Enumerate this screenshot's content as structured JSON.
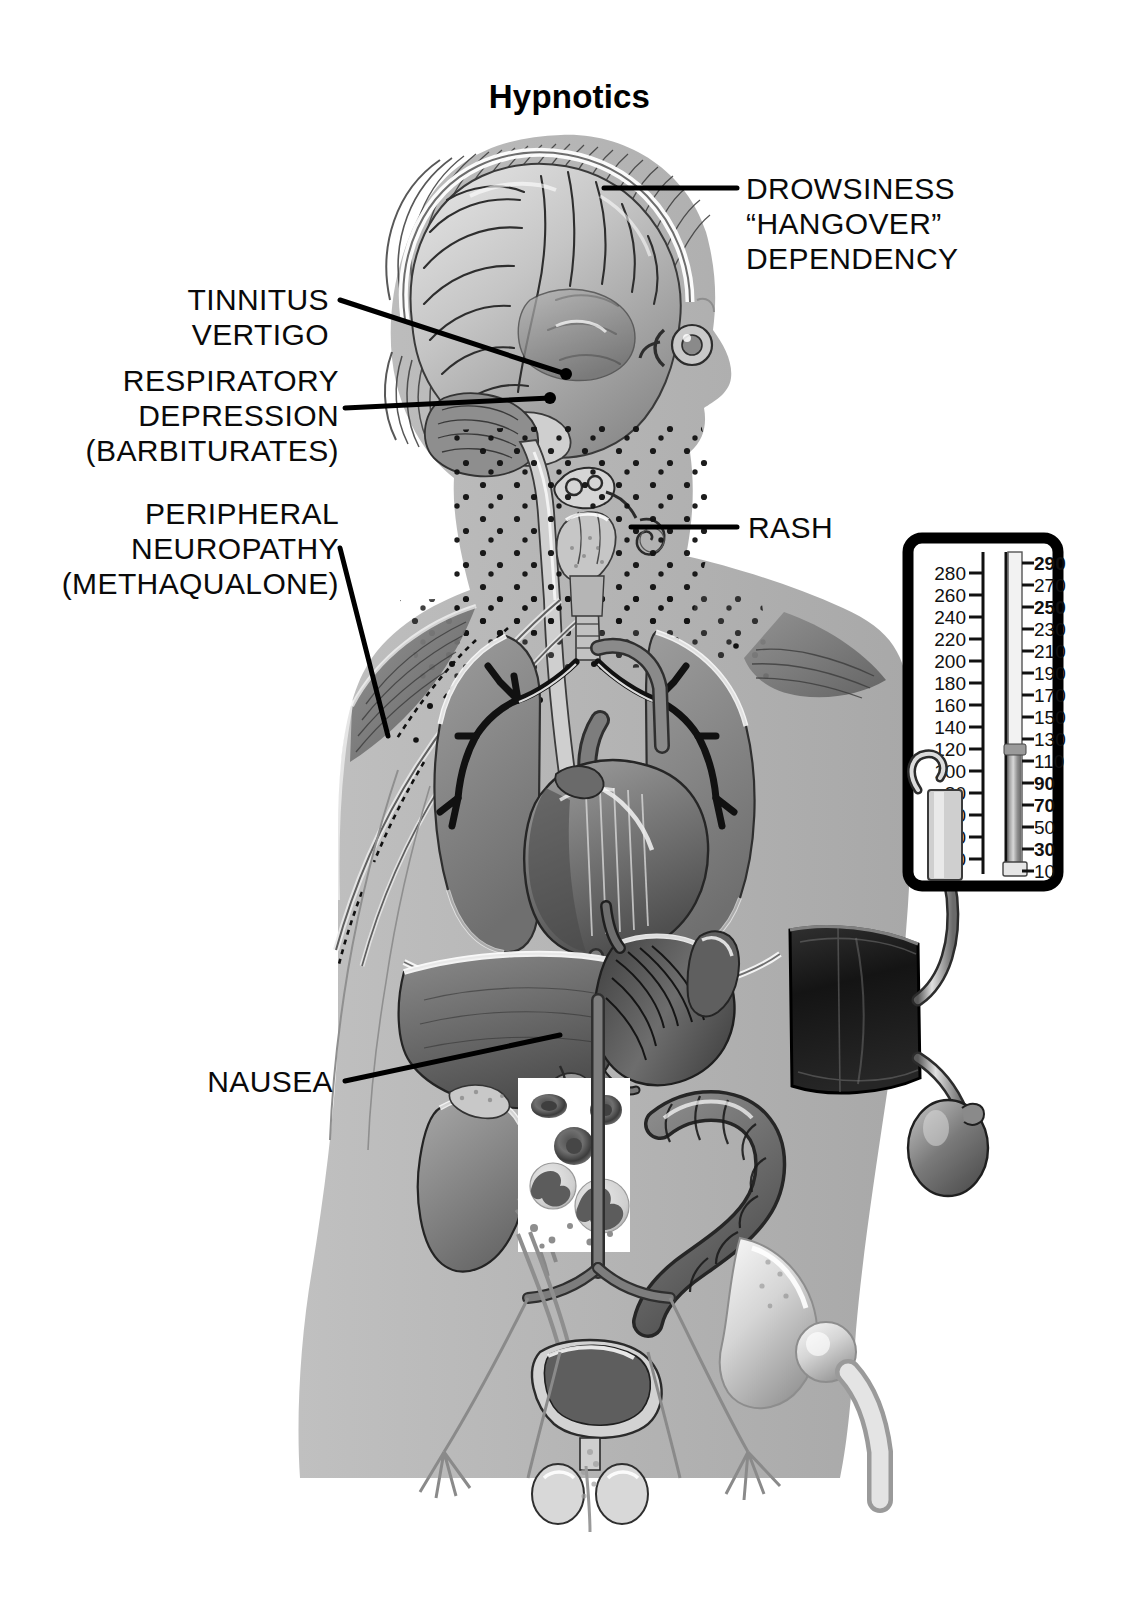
{
  "title": "Hypnotics",
  "palette": {
    "background": "#ffffff",
    "body_silhouette": "#b4b4b4",
    "outline": "#000000",
    "organ_mid": "#8e8e8e",
    "organ_dark": "#5a5a5a",
    "organ_light": "#d2d2d2",
    "highlight": "#ffffff",
    "label_text": "#0a0a0a",
    "cuff_dark": "#1b1b1b",
    "manometer_frame": "#000000"
  },
  "labels": [
    {
      "id": "drowsiness",
      "align": "left",
      "lines": [
        "DROWSINESS",
        "“HANGOVER”",
        "DEPENDENCY"
      ],
      "target": "cerebral-cortex"
    },
    {
      "id": "tinnitus-vertigo",
      "align": "right",
      "lines": [
        "TINNITUS",
        "VERTIGO"
      ],
      "target": "inner-ear"
    },
    {
      "id": "respiratory-depression",
      "align": "right",
      "lines": [
        "RESPIRATORY",
        "DEPRESSION",
        "(BARBITURATES)"
      ],
      "target": "brainstem-respiratory-center"
    },
    {
      "id": "peripheral-neuropathy",
      "align": "right",
      "lines": [
        "PERIPHERAL",
        "NEUROPATHY",
        "(METHAQUALONE)"
      ],
      "target": "peripheral-nerve-arm"
    },
    {
      "id": "rash",
      "align": "left",
      "lines": [
        "RASH"
      ],
      "target": "neck-skin-stippling"
    },
    {
      "id": "nausea",
      "align": "right",
      "lines": [
        "NAUSEA"
      ],
      "target": "stomach"
    }
  ],
  "sphygmomanometer": {
    "name": "mercury-sphygmomanometer",
    "left_scale": [
      280,
      260,
      240,
      220,
      200,
      180,
      160,
      140,
      120,
      100,
      80,
      60,
      40,
      20
    ],
    "right_scale": [
      290,
      270,
      250,
      230,
      210,
      190,
      170,
      150,
      130,
      110,
      90,
      70,
      50,
      30,
      10
    ],
    "mercury_level": 110,
    "parts": [
      "manometer-box",
      "mercury-column",
      "cuff",
      "tubing",
      "inflation-bulb"
    ]
  },
  "anatomy": {
    "head": [
      "scalp-hair",
      "skull",
      "cerebral-cortex",
      "cerebellum",
      "brainstem",
      "inner-ear",
      "eye"
    ],
    "neck": [
      "spinal-cord",
      "trachea",
      "thyroid-gland",
      "rash-stippling"
    ],
    "thorax": [
      "right-lung",
      "left-lung",
      "bronchial-tree",
      "heart",
      "aorta",
      "pulmonary-artery"
    ],
    "abdomen": [
      "liver",
      "stomach",
      "spleen",
      "kidney",
      "colon",
      "blood-smear-inset"
    ],
    "pelvis": [
      "bladder",
      "ureter",
      "aortic-bifurcation",
      "testes",
      "pelvic-bone",
      "femur",
      "nerve-plexus"
    ],
    "limbs": [
      "deltoid-muscle",
      "pectoral-muscle",
      "upper-arm",
      "peripheral-nerve"
    ]
  },
  "blood_smear_inset": {
    "name": "blood-smear-inset",
    "cells": [
      "erythrocyte",
      "erythrocyte",
      "erythrocyte",
      "neutrophil",
      "neutrophil",
      "platelets"
    ]
  }
}
